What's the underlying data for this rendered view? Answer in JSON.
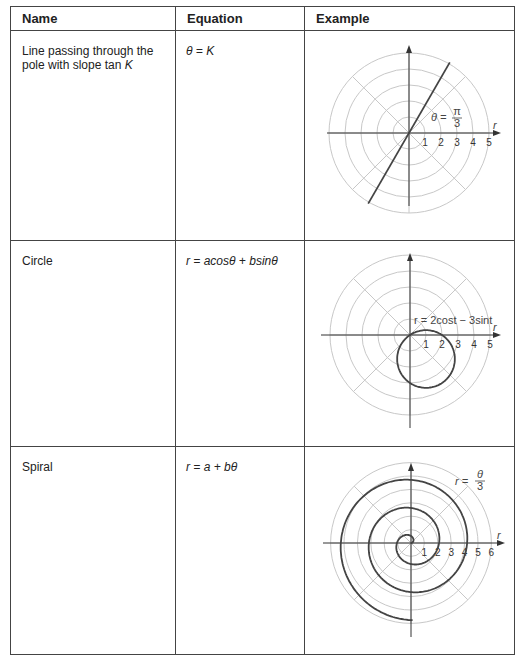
{
  "headers": {
    "name": "Name",
    "equation": "Equation",
    "example": "Example"
  },
  "rows": [
    {
      "name": "Line passing through the pole with slope tan K",
      "name_line1": "Line passing through the",
      "name_line2": "pole with slope tan ",
      "name_var": "K",
      "equation": "θ = K"
    },
    {
      "name": "Circle",
      "equation": "r = acosθ + bsinθ"
    },
    {
      "name": "Spiral",
      "equation": "r = a + bθ"
    }
  ],
  "chart_data": [
    {
      "type": "line",
      "title": "Line θ = π/3",
      "annotation": "θ = π/3",
      "annotation_num": "π",
      "annotation_den": "3",
      "axis_label": "r",
      "r_ticks": [
        "1",
        "2",
        "3",
        "4",
        "5"
      ],
      "rings": [
        1,
        2,
        3,
        4,
        5
      ],
      "spokes_deg": [
        0,
        45,
        90,
        135
      ],
      "theta": 1.0472
    },
    {
      "type": "line",
      "title": "Circle r = 2cos t − 3sin t",
      "annotation": "r = 2cost − 3sint",
      "axis_label": "r",
      "r_ticks": [
        "1",
        "2",
        "3",
        "4",
        "5"
      ],
      "rings": [
        1,
        2,
        3,
        4,
        5
      ],
      "spokes_deg": [
        0,
        45,
        90,
        135
      ],
      "a": 2,
      "b": -3
    },
    {
      "type": "line",
      "title": "Spiral r = θ/3",
      "annotation": "r = θ/3",
      "annotation_lhs": "r =",
      "annotation_num": "θ",
      "annotation_den": "3",
      "axis_label": "r",
      "r_ticks": [
        "1",
        "2",
        "3",
        "4",
        "5",
        "6"
      ],
      "rings": [
        1,
        2,
        3,
        4,
        5,
        6
      ],
      "spokes_deg": [
        0,
        45,
        90,
        135
      ],
      "a": 0,
      "b": 0.3333,
      "theta_max": 17.3
    }
  ]
}
